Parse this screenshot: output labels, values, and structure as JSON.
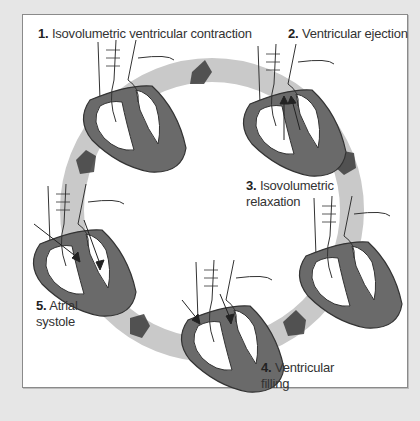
{
  "colors": {
    "background": "#e6e6e6",
    "panel": "#ffffff",
    "border": "#8a8a8a",
    "ring_light": "#c8c8c8",
    "ring_dark": "#5a5a5a",
    "myocardium": "#6a6a6a",
    "outline": "#333333"
  },
  "stages": [
    {
      "number": "1.",
      "name": "Isovolumetric ventricular contraction",
      "lines": [
        "Isovolumetric ventricular contraction"
      ]
    },
    {
      "number": "2.",
      "name": "Ventricular ejection",
      "lines": [
        "Ventricular ejection"
      ]
    },
    {
      "number": "3.",
      "name": "Isovolumetric relaxation",
      "lines": [
        "Isovolumetric",
        "relaxation"
      ]
    },
    {
      "number": "4.",
      "name": "Ventricular filling",
      "lines": [
        "Ventricular",
        "filling"
      ]
    },
    {
      "number": "5.",
      "name": "Atrial systole",
      "lines": [
        "Atrial",
        "systole"
      ]
    }
  ]
}
